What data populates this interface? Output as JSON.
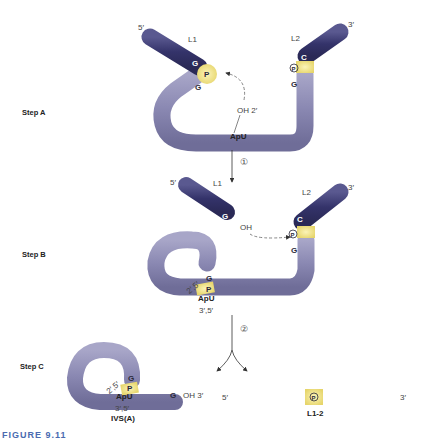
{
  "steps": {
    "a": "Step A",
    "b": "Step B",
    "c": "Step C"
  },
  "stepA": {
    "five_prime": "5′",
    "three_prime": "3′",
    "l1": "L1",
    "l2": "L2",
    "g_upper": "G",
    "p_left": "P",
    "g_lower": "G",
    "c_right": "C",
    "p_right": "P",
    "g_right": "G",
    "oh": "OH 2′",
    "apu": "ApU"
  },
  "arrow1": {
    "label": "①"
  },
  "stepB": {
    "five_prime": "5′",
    "three_prime": "3′",
    "l1": "L1",
    "l2": "L2",
    "g_l1": "G",
    "oh": "OH",
    "c_right": "C",
    "p_right": "P",
    "g_right": "G",
    "g_loop": "G",
    "p_loop": "P",
    "link": "2′,5′",
    "apu": "ApU",
    "link35": "3′,5′"
  },
  "arrow2": {
    "label": "②"
  },
  "stepC": {
    "g_loop": "G",
    "p_loop": "P",
    "link": "2′,5′",
    "apu": "ApU",
    "link35": "3′,5′",
    "g_end": "G",
    "oh_end": "OH 3′",
    "name": "IVS(A)",
    "product_five": "5′",
    "product_three": "3′",
    "product_g": "G",
    "product_p": "P",
    "product_c": "C",
    "product_name": "L1-2"
  },
  "caption": "FIGURE 9.11",
  "colors": {
    "exon": "#3b3a6e",
    "intron": "#8a88b0",
    "phosphate": "#f0e08a"
  }
}
